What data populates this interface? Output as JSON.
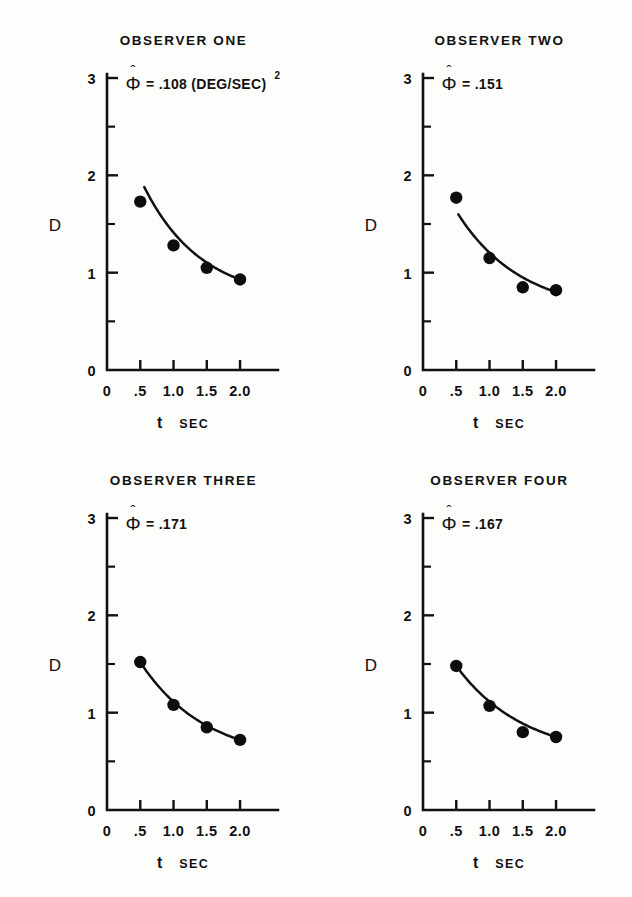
{
  "figure": {
    "panel_count": 4,
    "background_color": "#fdfdfc",
    "ink_color": "#111111"
  },
  "axes": {
    "ylabel": "D",
    "xlabel_variable": "t",
    "xlabel_unit": "SEC",
    "x_tick_labels": [
      "0",
      ".5",
      "1.0",
      "1.5",
      "2.0"
    ],
    "y_tick_labels": [
      "0",
      "1",
      "2",
      "3"
    ],
    "x_origin_label": "0",
    "y_origin_label": "0"
  },
  "chart_data": {
    "type": "scatter",
    "title": "",
    "xlabel": "t SEC",
    "ylabel": "D",
    "xlim": [
      0,
      2.3
    ],
    "ylim": [
      0,
      3
    ],
    "x_ticks": [
      0,
      0.5,
      1.0,
      1.5,
      2.0
    ],
    "y_ticks": [
      0,
      1,
      2,
      3
    ],
    "y_minor_ticks": [
      0.5,
      1.5,
      2.5
    ],
    "grid": false,
    "legend": "none",
    "x": [
      0.5,
      1.0,
      1.5,
      2.0
    ],
    "panels": [
      {
        "title": "OBSERVER  ONE",
        "annotation_symbol": "Φ",
        "annotation_hat": true,
        "annotation_value": "= .108 (DEG/SEC)",
        "annotation_exponent": "2",
        "annotation_plain": "Φ̂ = .108 (DEG/SEC)²",
        "phi_estimate": 0.108,
        "values": [
          1.73,
          1.28,
          1.05,
          0.93
        ],
        "fit_curve": {
          "description": "fitted decay curve",
          "start_x": 0.56,
          "start_y": 1.88,
          "end_x": 2.0,
          "end_y": 0.93
        }
      },
      {
        "title": "OBSERVER TWO",
        "annotation_symbol": "Φ",
        "annotation_hat": true,
        "annotation_value": "= .151",
        "annotation_exponent": "",
        "annotation_plain": "Φ̂ = .151",
        "phi_estimate": 0.151,
        "values": [
          1.77,
          1.15,
          0.85,
          0.82
        ],
        "fit_curve": {
          "description": "fitted decay curve",
          "start_x": 0.53,
          "start_y": 1.6,
          "end_x": 2.0,
          "end_y": 0.8
        }
      },
      {
        "title": "OBSERVER  THREE",
        "annotation_symbol": "Φ",
        "annotation_hat": true,
        "annotation_value": "= .171",
        "annotation_exponent": "",
        "annotation_plain": "Φ̂ = .171",
        "phi_estimate": 0.171,
        "values": [
          1.52,
          1.08,
          0.85,
          0.72
        ],
        "fit_curve": {
          "description": "fitted decay curve",
          "start_x": 0.5,
          "start_y": 1.52,
          "end_x": 2.0,
          "end_y": 0.72
        }
      },
      {
        "title": "OBSERVER  FOUR",
        "annotation_symbol": "Φ",
        "annotation_hat": true,
        "annotation_value": "= .167",
        "annotation_exponent": "",
        "annotation_plain": "Φ̂ = .167",
        "phi_estimate": 0.167,
        "values": [
          1.48,
          1.07,
          0.8,
          0.75
        ],
        "fit_curve": {
          "description": "fitted decay curve",
          "start_x": 0.5,
          "start_y": 1.48,
          "end_x": 2.0,
          "end_y": 0.75
        }
      }
    ]
  }
}
